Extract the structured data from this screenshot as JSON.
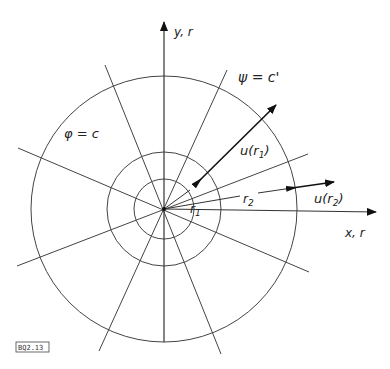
{
  "diagram": {
    "type": "polar-coordinate-flow-field",
    "labels": {
      "y_axis": "y, r",
      "x_axis": "x, r",
      "potential_line": "φ = c",
      "stream_line": "ψ = c'",
      "r1": "r",
      "r1_sub": "1",
      "r2": "r",
      "r2_sub": "2",
      "u_r1": "u(r",
      "u_r1_sub": "1",
      "u_r1_close": ")",
      "u_r2": "u(r",
      "u_r2_sub": "2",
      "u_r2_close": ")"
    },
    "figure_tag": "BQ2.13",
    "circles": [
      "inner",
      "middle",
      "outer"
    ],
    "radial_lines": 4,
    "line_color": "#333333"
  }
}
